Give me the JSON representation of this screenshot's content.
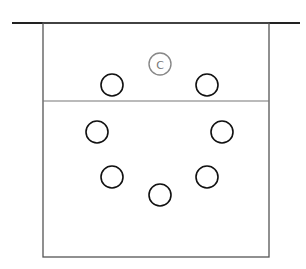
{
  "diagram": {
    "type": "court-positions",
    "colors": {
      "background": "#ffffff",
      "line": "#222222",
      "wall": "#555555",
      "player": "#111111",
      "center": "#888888"
    },
    "baseline": {
      "x1": 12,
      "x2": 300,
      "y": 23
    },
    "court": {
      "x": 43,
      "y": 23,
      "width": 226,
      "height": 234
    },
    "divider_y": 101,
    "center_marker": {
      "label": "C",
      "cx": 160,
      "cy": 64,
      "r": 11
    },
    "players": [
      {
        "id": 1,
        "cx": 112,
        "cy": 85,
        "r": 11
      },
      {
        "id": 2,
        "cx": 207,
        "cy": 85,
        "r": 11
      },
      {
        "id": 3,
        "cx": 97,
        "cy": 132,
        "r": 11
      },
      {
        "id": 4,
        "cx": 222,
        "cy": 132,
        "r": 11
      },
      {
        "id": 5,
        "cx": 112,
        "cy": 177,
        "r": 11
      },
      {
        "id": 6,
        "cx": 160,
        "cy": 195,
        "r": 11
      },
      {
        "id": 7,
        "cx": 207,
        "cy": 177,
        "r": 11
      }
    ]
  }
}
